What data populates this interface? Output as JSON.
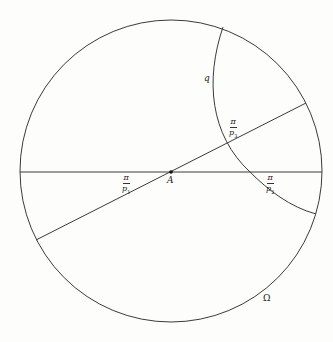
{
  "figure": {
    "type": "hyperbolic disk diagram",
    "circle": {
      "cx": 171,
      "cy": 171,
      "r": 151,
      "label": "Ω"
    },
    "center_point": {
      "x": 171,
      "y": 172,
      "label": "A"
    },
    "horizontal_chord": {
      "x1": 20,
      "y1": 172,
      "x2": 322,
      "y2": 172
    },
    "oblique_chord": {
      "x1": 36,
      "y1": 240,
      "x2": 306,
      "y2": 103
    },
    "arc_q": {
      "label": "q",
      "path": "M 223 27 Q 196 110 250 172 Q 275 200 316 214"
    },
    "angle_labels": [
      {
        "id": "p1",
        "numerator": "π",
        "denominator": "p",
        "subscript": "1",
        "x": 122,
        "y": 174
      },
      {
        "id": "p2",
        "numerator": "π",
        "denominator": "p",
        "subscript": "2",
        "x": 265,
        "y": 174
      },
      {
        "id": "p3",
        "numerator": "π",
        "denominator": "p",
        "subscript": "3",
        "x": 229,
        "y": 118
      }
    ],
    "point_label": "A",
    "boundary_label": "Ω",
    "curve_label": "q",
    "caption": ""
  }
}
